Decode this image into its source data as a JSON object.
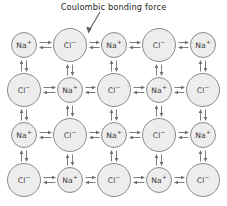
{
  "figure": {
    "width": 227,
    "height": 206,
    "background": "#ffffff"
  },
  "annotation": {
    "text": "Coulombic bonding force",
    "pointer_icon": "annotation-arrow-icon",
    "points_to": "bond between Cl- and Na+ in row 1, columns 2-3"
  },
  "style": {
    "ion_fill": "#ededed",
    "ion_stroke": "#8a8a8a",
    "label_color": "#3a3a3a",
    "arrow_color": "#6e6e6e",
    "text_color": "#231f20"
  },
  "lattice": {
    "rows": 4,
    "cols": 5,
    "description": "NaCl ionic lattice cross-section, alternating cation and anion checkerboard",
    "column_centers": [
      24,
      70,
      114,
      159,
      203
    ],
    "row_centers": [
      45,
      90,
      135,
      180
    ],
    "species": {
      "cation": {
        "name": "sodium-ion",
        "element": "Na",
        "charge": "+",
        "radius": 13
      },
      "anion": {
        "name": "chloride-ion",
        "element": "Cl",
        "charge": "−",
        "radius": 17
      }
    },
    "grid": [
      [
        "cation",
        "anion",
        "cation",
        "anion",
        "cation"
      ],
      [
        "anion",
        "cation",
        "anion",
        "cation",
        "anion"
      ],
      [
        "cation",
        "anion",
        "cation",
        "anion",
        "cation"
      ],
      [
        "anion",
        "cation",
        "anion",
        "cation",
        "anion"
      ]
    ]
  },
  "bonds": {
    "horizontal_icon": "double-arrow-horizontal-icon",
    "vertical_icon": "double-arrow-vertical-icon",
    "meaning": "attractive Coulombic force between adjacent oppositely charged ions"
  }
}
